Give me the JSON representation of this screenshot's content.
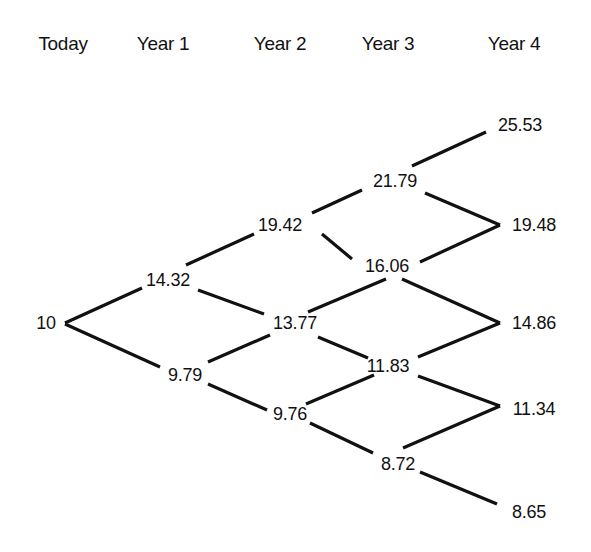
{
  "diagram": {
    "type": "binomial-tree",
    "headers": [
      "Today",
      "Year 1",
      "Year 2",
      "Year 3",
      "Year 4"
    ],
    "levels": [
      [
        "10"
      ],
      [
        "14.32",
        "9.79"
      ],
      [
        "19.42",
        "13.77",
        "9.76"
      ],
      [
        "21.79",
        "16.06",
        "11.83",
        "8.72"
      ],
      [
        "25.53",
        "19.48",
        "14.86",
        "11.34",
        "8.65"
      ]
    ],
    "edges": [
      {
        "from": "10",
        "to": "14.32"
      },
      {
        "from": "10",
        "to": "9.79"
      },
      {
        "from": "14.32",
        "to": "19.42"
      },
      {
        "from": "14.32",
        "to": "13.77"
      },
      {
        "from": "9.79",
        "to": "13.77"
      },
      {
        "from": "9.79",
        "to": "9.76"
      },
      {
        "from": "19.42",
        "to": "21.79"
      },
      {
        "from": "19.42",
        "to": "16.06"
      },
      {
        "from": "13.77",
        "to": "16.06"
      },
      {
        "from": "13.77",
        "to": "11.83"
      },
      {
        "from": "9.76",
        "to": "11.83"
      },
      {
        "from": "9.76",
        "to": "8.72"
      },
      {
        "from": "21.79",
        "to": "25.53"
      },
      {
        "from": "21.79",
        "to": "19.48"
      },
      {
        "from": "16.06",
        "to": "19.48"
      },
      {
        "from": "16.06",
        "to": "14.86"
      },
      {
        "from": "11.83",
        "to": "14.86"
      },
      {
        "from": "11.83",
        "to": "11.34"
      },
      {
        "from": "8.72",
        "to": "11.34"
      },
      {
        "from": "8.72",
        "to": "8.65"
      }
    ]
  }
}
